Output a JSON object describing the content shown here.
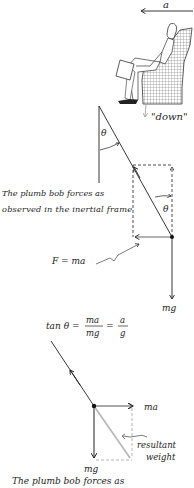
{
  "top": {
    "accel_label": "a",
    "down_label": "\"down\""
  },
  "upper_diagram": {
    "theta_top": "θ",
    "theta_inner": "θ",
    "caption_line1": "The plumb bob forces as",
    "caption_line2": "observed in the inertial frame",
    "force_label": "F = ma",
    "weight_label": "mg"
  },
  "equation": {
    "prefix": "tan θ =",
    "frac1_num": "ma",
    "frac1_den": "mg",
    "equals": "=",
    "frac2_num": "a",
    "frac2_den": "g"
  },
  "lower_diagram": {
    "horizontal_label": "ma",
    "vertical_label": "mg",
    "resultant_line1": "resultant",
    "resultant_line2": "weight",
    "caption_line1": "The plumb bob forces as"
  },
  "colors": {
    "ink": "#222222",
    "gray_line": "#b5b5b5",
    "chair_fill": "#d8d8d8"
  }
}
